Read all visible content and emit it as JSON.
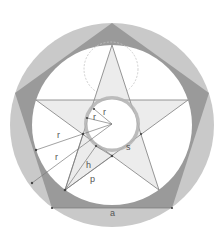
{
  "diagram": {
    "colors": {
      "background": "#ffffff",
      "outer_ring": "#c9c9c9",
      "pentagon_band": "#9a9a9a",
      "white_disk": "#ffffff",
      "star_fill": "#ececec",
      "star_stroke": "#8a8a8a",
      "inner_ring": "#b4b4b4",
      "dashed_circle": "#bdbdbd",
      "construction_line": "#777777",
      "label": "#555555"
    },
    "labels": {
      "r_outer_1": "r",
      "r_outer_2": "r",
      "r_inner_1": "r",
      "r_inner_2": "r",
      "h": "h",
      "p": "p",
      "s": "s",
      "a": "a"
    }
  }
}
